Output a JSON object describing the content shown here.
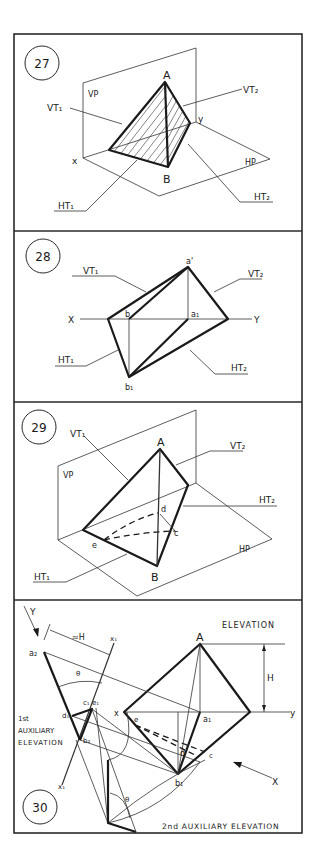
{
  "panels": [
    {
      "number": "27",
      "labels": {
        "A": "A",
        "B": "B",
        "VP": "VP",
        "HP": "HP",
        "x": "x",
        "y": "y",
        "VT1": "VT₁",
        "VT2": "VT₂",
        "HT1": "HT₁",
        "HT2": "HT₂"
      }
    },
    {
      "number": "28",
      "labels": {
        "a_prime": "a'",
        "b": "b",
        "a1": "a₁",
        "b1": "b₁",
        "X": "X",
        "Y": "Y",
        "VT1": "VT₁",
        "VT2": "VT₂",
        "HT1": "HT₁",
        "HT2": "HT₂"
      }
    },
    {
      "number": "29",
      "labels": {
        "A": "A",
        "B": "B",
        "VP": "VP",
        "HP": "HP",
        "d": "d",
        "c": "c",
        "e": "e",
        "VT1": "VT₁",
        "VT2": "VT₂",
        "HT1": "HT₁",
        "HT2": "HT₂"
      }
    },
    {
      "number": "30",
      "labels": {
        "Y": "Y",
        "X": "X",
        "A": "A",
        "H": "H",
        "approx_H": "≈H",
        "theta": "θ",
        "a2": "a₂",
        "c1e1": "c₁ e₁",
        "d1": "d₁",
        "b2": "b₂",
        "x": "x",
        "y": "y",
        "a1": "a₁",
        "d": "d",
        "c": "c",
        "e": "e",
        "b1": "b₁",
        "x1_top": "x₁",
        "x1_bottom": "x₁",
        "elevation": "ELEVATION",
        "first_aux_1": "1st",
        "first_aux_2": "AUXILIARY",
        "first_aux_3": "ELEVATION",
        "second_aux": "2nd AUXILIARY ELEVATION"
      }
    }
  ]
}
